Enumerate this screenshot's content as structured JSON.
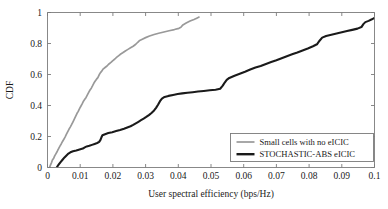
{
  "chart_data": {
    "type": "line",
    "title": "",
    "xlabel": "User spectral efficiency (bps/Hz)",
    "ylabel": "CDF",
    "xlim": [
      0,
      0.1
    ],
    "ylim": [
      0,
      1
    ],
    "grid": false,
    "legend_position": "lower right",
    "xticks": [
      0,
      0.01,
      0.02,
      0.03,
      0.04,
      0.05,
      0.06,
      0.07,
      0.08,
      0.09,
      0.1
    ],
    "xticklabels": [
      "0",
      "0.01",
      "0.02",
      "0.03",
      "0.04",
      "0.05",
      "0.06",
      "0.07",
      "0.08",
      "0.09",
      "0.1"
    ],
    "yticks": [
      0,
      0.2,
      0.4,
      0.6,
      0.8,
      1
    ],
    "yticklabels": [
      "0",
      "0.2",
      "0.4",
      "0.6",
      "0.8",
      "1"
    ],
    "series": [
      {
        "name": "Small cells with no eICIC",
        "color": "#999999",
        "width": 1.7,
        "points": [
          [
            0.0006,
            0.0
          ],
          [
            0.0009,
            0.015
          ],
          [
            0.0012,
            0.03
          ],
          [
            0.0015,
            0.048
          ],
          [
            0.0019,
            0.06
          ],
          [
            0.0022,
            0.075
          ],
          [
            0.0026,
            0.09
          ],
          [
            0.003,
            0.105
          ],
          [
            0.0034,
            0.122
          ],
          [
            0.0038,
            0.138
          ],
          [
            0.0042,
            0.152
          ],
          [
            0.0046,
            0.168
          ],
          [
            0.005,
            0.182
          ],
          [
            0.0054,
            0.198
          ],
          [
            0.0058,
            0.215
          ],
          [
            0.0062,
            0.232
          ],
          [
            0.0066,
            0.248
          ],
          [
            0.007,
            0.262
          ],
          [
            0.0074,
            0.278
          ],
          [
            0.0078,
            0.295
          ],
          [
            0.0082,
            0.312
          ],
          [
            0.0086,
            0.33
          ],
          [
            0.009,
            0.348
          ],
          [
            0.0094,
            0.362
          ],
          [
            0.0098,
            0.38
          ],
          [
            0.0102,
            0.395
          ],
          [
            0.0106,
            0.41
          ],
          [
            0.011,
            0.428
          ],
          [
            0.0114,
            0.44
          ],
          [
            0.0118,
            0.452
          ],
          [
            0.0122,
            0.468
          ],
          [
            0.0126,
            0.485
          ],
          [
            0.013,
            0.5
          ],
          [
            0.0134,
            0.512
          ],
          [
            0.0138,
            0.528
          ],
          [
            0.0142,
            0.545
          ],
          [
            0.0146,
            0.558
          ],
          [
            0.015,
            0.57
          ],
          [
            0.0154,
            0.58
          ],
          [
            0.0158,
            0.598
          ],
          [
            0.0162,
            0.612
          ],
          [
            0.0166,
            0.622
          ],
          [
            0.017,
            0.635
          ],
          [
            0.0176,
            0.645
          ],
          [
            0.0182,
            0.655
          ],
          [
            0.0188,
            0.668
          ],
          [
            0.0194,
            0.678
          ],
          [
            0.02,
            0.69
          ],
          [
            0.0206,
            0.7
          ],
          [
            0.0212,
            0.712
          ],
          [
            0.0218,
            0.722
          ],
          [
            0.0224,
            0.732
          ],
          [
            0.023,
            0.74
          ],
          [
            0.0238,
            0.752
          ],
          [
            0.0246,
            0.762
          ],
          [
            0.0254,
            0.772
          ],
          [
            0.0262,
            0.782
          ],
          [
            0.027,
            0.795
          ],
          [
            0.0276,
            0.808
          ],
          [
            0.0282,
            0.82
          ],
          [
            0.029,
            0.828
          ],
          [
            0.03,
            0.838
          ],
          [
            0.0312,
            0.848
          ],
          [
            0.0326,
            0.858
          ],
          [
            0.034,
            0.866
          ],
          [
            0.0356,
            0.874
          ],
          [
            0.0372,
            0.882
          ],
          [
            0.0388,
            0.89
          ],
          [
            0.0402,
            0.898
          ],
          [
            0.0408,
            0.905
          ],
          [
            0.0414,
            0.92
          ],
          [
            0.0424,
            0.932
          ],
          [
            0.0436,
            0.945
          ],
          [
            0.0448,
            0.955
          ],
          [
            0.0458,
            0.965
          ],
          [
            0.0465,
            0.972
          ]
        ]
      },
      {
        "name": "STOCHASTIC-ABS eICIC",
        "color": "#1a1a1a",
        "width": 2.1,
        "points": [
          [
            0.0028,
            0.0
          ],
          [
            0.0034,
            0.018
          ],
          [
            0.004,
            0.035
          ],
          [
            0.0046,
            0.05
          ],
          [
            0.0052,
            0.065
          ],
          [
            0.0058,
            0.078
          ],
          [
            0.0064,
            0.09
          ],
          [
            0.007,
            0.098
          ],
          [
            0.0078,
            0.105
          ],
          [
            0.0088,
            0.11
          ],
          [
            0.0098,
            0.116
          ],
          [
            0.0108,
            0.122
          ],
          [
            0.0114,
            0.13
          ],
          [
            0.012,
            0.136
          ],
          [
            0.0128,
            0.14
          ],
          [
            0.0136,
            0.146
          ],
          [
            0.0144,
            0.152
          ],
          [
            0.0152,
            0.158
          ],
          [
            0.0158,
            0.165
          ],
          [
            0.0162,
            0.178
          ],
          [
            0.0165,
            0.195
          ],
          [
            0.0168,
            0.208
          ],
          [
            0.0176,
            0.215
          ],
          [
            0.0186,
            0.222
          ],
          [
            0.0198,
            0.228
          ],
          [
            0.021,
            0.235
          ],
          [
            0.0222,
            0.242
          ],
          [
            0.0234,
            0.25
          ],
          [
            0.0244,
            0.258
          ],
          [
            0.0254,
            0.266
          ],
          [
            0.0262,
            0.275
          ],
          [
            0.027,
            0.285
          ],
          [
            0.0278,
            0.295
          ],
          [
            0.0286,
            0.305
          ],
          [
            0.0294,
            0.315
          ],
          [
            0.0302,
            0.326
          ],
          [
            0.031,
            0.338
          ],
          [
            0.0318,
            0.352
          ],
          [
            0.0326,
            0.368
          ],
          [
            0.0332,
            0.385
          ],
          [
            0.0338,
            0.405
          ],
          [
            0.0344,
            0.428
          ],
          [
            0.035,
            0.445
          ],
          [
            0.0358,
            0.455
          ],
          [
            0.037,
            0.462
          ],
          [
            0.0384,
            0.468
          ],
          [
            0.0398,
            0.474
          ],
          [
            0.0412,
            0.478
          ],
          [
            0.0428,
            0.482
          ],
          [
            0.0444,
            0.486
          ],
          [
            0.046,
            0.49
          ],
          [
            0.0478,
            0.494
          ],
          [
            0.0496,
            0.498
          ],
          [
            0.0514,
            0.502
          ],
          [
            0.0528,
            0.508
          ],
          [
            0.0536,
            0.528
          ],
          [
            0.0542,
            0.548
          ],
          [
            0.0548,
            0.565
          ],
          [
            0.0556,
            0.578
          ],
          [
            0.0572,
            0.592
          ],
          [
            0.0588,
            0.605
          ],
          [
            0.0604,
            0.618
          ],
          [
            0.062,
            0.632
          ],
          [
            0.0636,
            0.645
          ],
          [
            0.0652,
            0.655
          ],
          [
            0.0668,
            0.668
          ],
          [
            0.0684,
            0.68
          ],
          [
            0.07,
            0.692
          ],
          [
            0.0716,
            0.705
          ],
          [
            0.0732,
            0.718
          ],
          [
            0.0748,
            0.73
          ],
          [
            0.0764,
            0.742
          ],
          [
            0.078,
            0.755
          ],
          [
            0.0796,
            0.768
          ],
          [
            0.0812,
            0.782
          ],
          [
            0.0824,
            0.795
          ],
          [
            0.0832,
            0.818
          ],
          [
            0.084,
            0.838
          ],
          [
            0.0852,
            0.848
          ],
          [
            0.0868,
            0.856
          ],
          [
            0.0884,
            0.864
          ],
          [
            0.09,
            0.872
          ],
          [
            0.0916,
            0.88
          ],
          [
            0.0932,
            0.888
          ],
          [
            0.0948,
            0.896
          ],
          [
            0.096,
            0.906
          ],
          [
            0.0966,
            0.925
          ],
          [
            0.0972,
            0.938
          ],
          [
            0.0982,
            0.946
          ],
          [
            0.0992,
            0.956
          ],
          [
            0.1,
            0.965
          ]
        ]
      }
    ]
  },
  "legend": {
    "entries": [
      {
        "label": "Small cells with no eICIC",
        "color": "#999999"
      },
      {
        "label": "STOCHASTIC-ABS eICIC",
        "color": "#1a1a1a"
      }
    ]
  }
}
